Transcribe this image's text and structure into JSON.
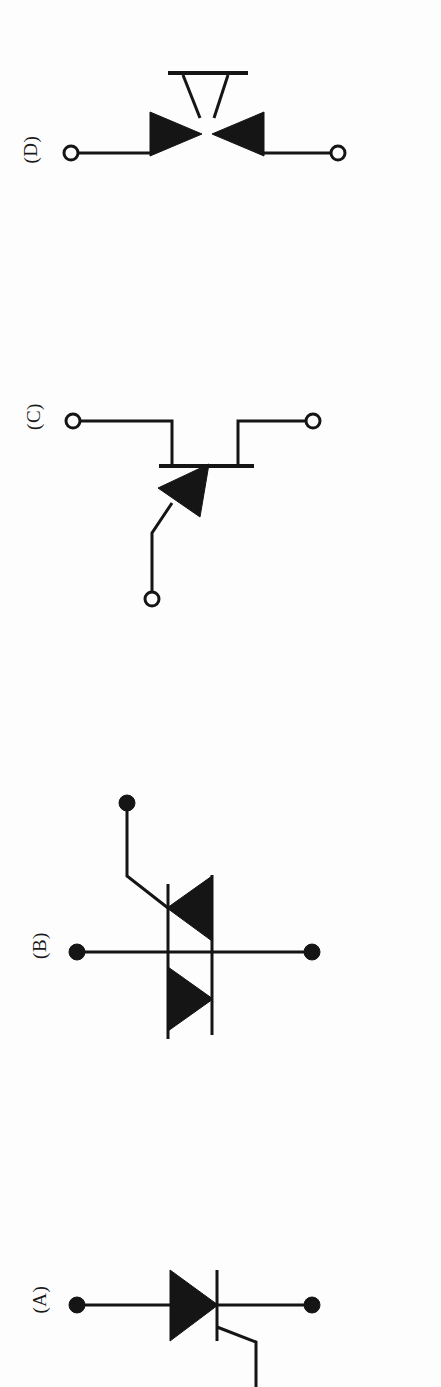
{
  "figure": {
    "orientation": "rotated-90",
    "background_color": "#fdfdfd",
    "ink_color": "#151515",
    "panels": [
      {
        "id": "panel-d",
        "label": "(D)",
        "device": "diac",
        "label_x": 30,
        "label_y": 155,
        "terminals": [
          {
            "name": "main-terminal-1",
            "type": "open-circle",
            "x": 71,
            "y": 153
          },
          {
            "name": "main-terminal-2",
            "type": "open-circle",
            "x": 338,
            "y": 153
          }
        ],
        "elements": {
          "left_lead_x1": 78,
          "left_lead_x2": 152,
          "lead_y": 153,
          "right_lead_x1": 262,
          "right_lead_x2": 331,
          "bar_x1": 168,
          "bar_x2": 248,
          "bar_y": 73,
          "left_triangle": "152,113 152,155 200,134",
          "right_triangle": "262,113 262,155 214,134",
          "left_stem": "183,75 200,116",
          "right_stem": "228,75 214,116"
        }
      },
      {
        "id": "panel-c",
        "label": "(C)",
        "device": "silicon-controlled-rectifier",
        "label_x": 33,
        "label_y": 419,
        "terminals": [
          {
            "name": "anode",
            "type": "open-circle",
            "x": 73,
            "y": 421
          },
          {
            "name": "cathode",
            "type": "open-circle",
            "x": 313,
            "y": 421
          },
          {
            "name": "gate",
            "type": "open-circle",
            "x": 152,
            "y": 599
          }
        ],
        "elements": {
          "anode_lead": "80,421 172,421 172,466",
          "cathode_lead": "306,421 238,421 238,466",
          "bar_x1": 161,
          "bar_x2": 252,
          "bar_y": 466,
          "triangle": "161,487 205,467 200,512",
          "gate_lead": "171,502 152,533 152,592"
        }
      },
      {
        "id": "panel-b",
        "label": "(B)",
        "device": "triac",
        "label_x": 39,
        "label_y": 951,
        "terminals": [
          {
            "name": "main-terminal-1",
            "type": "solid-dot",
            "x": 77,
            "y": 952
          },
          {
            "name": "main-terminal-2",
            "type": "solid-dot",
            "x": 312,
            "y": 952
          },
          {
            "name": "gate",
            "type": "solid-dot",
            "x": 127,
            "y": 803
          }
        ],
        "elements": {
          "main_line_x1": 77,
          "main_line_x2": 312,
          "main_line_y": 952,
          "left_bar_x": 168,
          "left_bar_y1": 884,
          "left_bar_y2": 1039,
          "right_bar_x": 212,
          "right_bar_y1": 875,
          "right_bar_y2": 1035,
          "upper_triangle": "212,877 212,940 168,908",
          "lower_triangle": "168,968 168,1030 212,999",
          "gate_lead": "127,809 127,875 168,908"
        }
      },
      {
        "id": "panel-a",
        "label": "(A)",
        "device": "silicon-controlled-rectifier",
        "label_x": 39,
        "label_y": 1304,
        "terminals": [
          {
            "name": "anode",
            "type": "solid-dot",
            "x": 77,
            "y": 1305
          },
          {
            "name": "cathode",
            "type": "solid-dot",
            "x": 312,
            "y": 1305
          }
        ],
        "elements": {
          "main_line_x1": 77,
          "main_line_x2": 312,
          "main_line_y": 1305,
          "triangle": "170,1271 170,1340 216,1305",
          "cathode_bar_x": 216,
          "cathode_bar_y1": 1271,
          "cathode_bar_y2": 1340,
          "gate_lead": "216,1327 255,1341 255,1387"
        }
      }
    ]
  }
}
